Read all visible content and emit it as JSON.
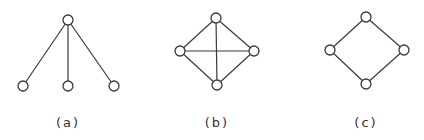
{
  "graphs": [
    {
      "id": "a",
      "label": "(a)",
      "nodes": [
        "top",
        "bottom-left",
        "bottom-middle",
        "bottom-right"
      ],
      "edges": [
        [
          "top",
          "bottom-left"
        ],
        [
          "top",
          "bottom-middle"
        ],
        [
          "top",
          "bottom-right"
        ]
      ]
    },
    {
      "id": "b",
      "label": "(b)",
      "nodes": [
        "top",
        "left",
        "right",
        "bottom"
      ],
      "edges": [
        [
          "top",
          "left"
        ],
        [
          "top",
          "right"
        ],
        [
          "left",
          "bottom"
        ],
        [
          "right",
          "bottom"
        ],
        [
          "left",
          "right"
        ],
        [
          "top",
          "bottom"
        ]
      ]
    },
    {
      "id": "c",
      "label": "(c)",
      "nodes": [
        "top",
        "left",
        "right",
        "bottom"
      ],
      "edges": [
        [
          "top",
          "left"
        ],
        [
          "top",
          "right"
        ],
        [
          "left",
          "bottom"
        ],
        [
          "right",
          "bottom"
        ]
      ]
    }
  ]
}
